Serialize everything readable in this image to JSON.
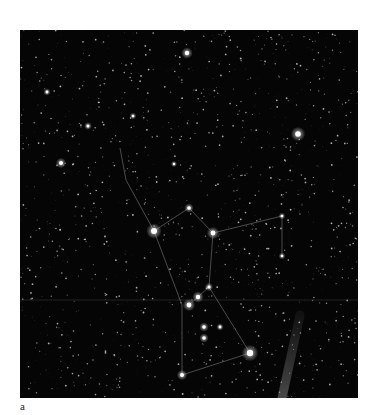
{
  "figure": {
    "panel_label": "a",
    "background": "#050505",
    "line_color": "#7a7a7a",
    "bright_stars": [
      {
        "x": 167,
        "y": 23,
        "r": 2.2
      },
      {
        "x": 41,
        "y": 133,
        "r": 2.0
      },
      {
        "x": 27,
        "y": 62,
        "r": 1.4
      },
      {
        "x": 68,
        "y": 96,
        "r": 1.5
      },
      {
        "x": 113,
        "y": 86,
        "r": 1.3
      },
      {
        "x": 134,
        "y": 201,
        "r": 3.0
      },
      {
        "x": 193,
        "y": 203,
        "r": 2.4
      },
      {
        "x": 278,
        "y": 104,
        "r": 2.8
      },
      {
        "x": 169,
        "y": 178,
        "r": 1.8
      },
      {
        "x": 262,
        "y": 186,
        "r": 1.3
      },
      {
        "x": 262,
        "y": 226,
        "r": 1.3
      },
      {
        "x": 189,
        "y": 257,
        "r": 1.6
      },
      {
        "x": 178,
        "y": 267,
        "r": 2.2
      },
      {
        "x": 169,
        "y": 275,
        "r": 2.4
      },
      {
        "x": 184,
        "y": 297,
        "r": 1.8
      },
      {
        "x": 184,
        "y": 308,
        "r": 1.8
      },
      {
        "x": 230,
        "y": 323,
        "r": 3.2
      },
      {
        "x": 162,
        "y": 345,
        "r": 2.0
      },
      {
        "x": 200,
        "y": 297,
        "r": 1.4
      },
      {
        "x": 154,
        "y": 134,
        "r": 1.2
      }
    ],
    "constellation_lines": [
      [
        134,
        201,
        169,
        178
      ],
      [
        169,
        178,
        193,
        203
      ],
      [
        193,
        203,
        262,
        186
      ],
      [
        262,
        186,
        262,
        226
      ],
      [
        134,
        201,
        106,
        150
      ],
      [
        106,
        150,
        100,
        118
      ],
      [
        193,
        203,
        189,
        257
      ],
      [
        134,
        201,
        162,
        275
      ],
      [
        169,
        275,
        189,
        257
      ],
      [
        189,
        257,
        230,
        323
      ],
      [
        162,
        275,
        162,
        345
      ],
      [
        162,
        345,
        230,
        323
      ]
    ],
    "streak": {
      "x1": 280,
      "y1": 285,
      "x2": 262,
      "y2": 368
    }
  }
}
